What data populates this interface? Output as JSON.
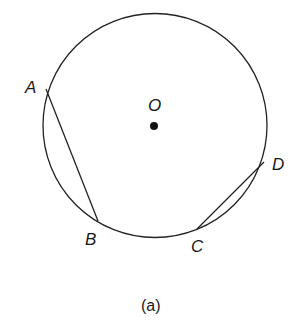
{
  "diagram": {
    "caption": "(a)",
    "circle": {
      "cx": 155,
      "cy": 125.5,
      "r": 112,
      "stroke": "#222222"
    },
    "center": {
      "label": "O",
      "x": 154,
      "y": 126
    },
    "points": {
      "A": {
        "label": "A",
        "x": 46,
        "y": 89
      },
      "B": {
        "label": "B",
        "x": 98,
        "y": 221
      },
      "C": {
        "label": "C",
        "x": 197,
        "y": 229
      },
      "D": {
        "label": "D",
        "x": 264,
        "y": 162
      }
    },
    "chords": [
      {
        "name": "AB",
        "from": "A",
        "to": "B"
      },
      {
        "name": "CD",
        "from": "C",
        "to": "D"
      }
    ]
  }
}
